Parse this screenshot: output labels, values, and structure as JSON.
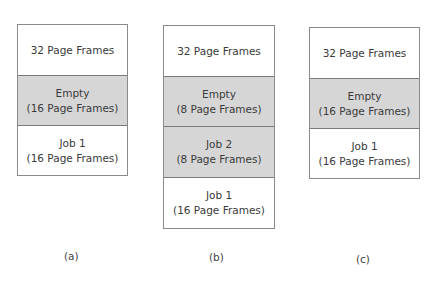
{
  "diagrams": [
    {
      "caption": "(a)",
      "cells": [
        {
          "line1": "32 Page Frames",
          "line2": "",
          "shaded": false
        },
        {
          "line1": "Empty",
          "line2": "(16 Page Frames)",
          "shaded": true
        },
        {
          "line1": "Job 1",
          "line2": "(16 Page Frames)",
          "shaded": false
        }
      ]
    },
    {
      "caption": "(b)",
      "cells": [
        {
          "line1": "32 Page Frames",
          "line2": "",
          "shaded": false
        },
        {
          "line1": "Empty",
          "line2": "(8 Page Frames)",
          "shaded": true
        },
        {
          "line1": "Job 2",
          "line2": "(8 Page Frames)",
          "shaded": true
        },
        {
          "line1": "Job 1",
          "line2": "(16 Page Frames)",
          "shaded": false
        }
      ]
    },
    {
      "caption": "(c)",
      "cells": [
        {
          "line1": "32 Page Frames",
          "line2": "",
          "shaded": false
        },
        {
          "line1": "Empty",
          "line2": "(16 Page Frames)",
          "shaded": true
        },
        {
          "line1": "Job 1",
          "line2": "(16 Page Frames)",
          "shaded": false
        }
      ]
    }
  ],
  "colors": {
    "shaded": "#d6d6d6",
    "border": "#8a8a8a"
  }
}
